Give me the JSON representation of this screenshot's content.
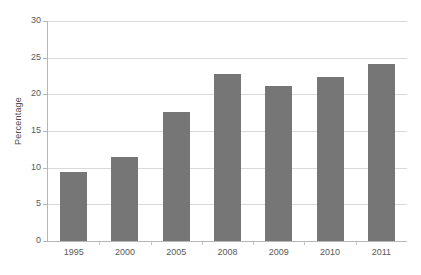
{
  "chart_data": {
    "type": "bar",
    "title": "",
    "xlabel": "",
    "ylabel": "Percentage",
    "categories": [
      "1995",
      "2000",
      "2005",
      "2008",
      "2009",
      "2010",
      "2011"
    ],
    "values": [
      9.4,
      11.4,
      17.6,
      22.8,
      21.1,
      22.4,
      24.1
    ],
    "ylim": [
      0,
      30
    ],
    "ytick_values": [
      0,
      5,
      10,
      15,
      20,
      25,
      30
    ],
    "ytick_labels": [
      "0",
      "5",
      "10",
      "15",
      "20",
      "25",
      "30"
    ],
    "grid": true,
    "legend": "none",
    "series": [
      {
        "name": "Percentage",
        "color": "#767676",
        "values": [
          9.4,
          11.4,
          17.6,
          22.8,
          21.1,
          22.4,
          24.1
        ]
      }
    ]
  },
  "colors": {
    "bar_fill": "#767676",
    "gridline": "#d9d9d9",
    "axis_line": "#b7b7b7",
    "text": "#5a5a5a",
    "background": "#ffffff"
  }
}
